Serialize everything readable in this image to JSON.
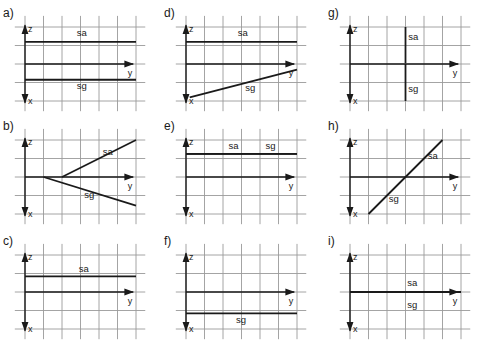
{
  "figure": {
    "colors": {
      "grid": "#9a9a9a",
      "lines": "#1a1a1a",
      "background": "#ffffff"
    },
    "axes": {
      "vertical_up": "z",
      "vertical_down": "x",
      "horizontal": "y"
    },
    "panels": [
      {
        "id": "a",
        "label": "a)",
        "col": 0,
        "row": 0,
        "traces": [
          {
            "name": "sa",
            "from": [
              0,
              -1.2
            ],
            "to": [
              6,
              -1.2
            ],
            "label_at": [
              2.8,
              -1.5
            ]
          },
          {
            "name": "sg",
            "from": [
              0,
              0.85
            ],
            "to": [
              6,
              0.85
            ],
            "label_at": [
              2.8,
              1.35
            ]
          }
        ]
      },
      {
        "id": "b",
        "label": "b)",
        "col": 0,
        "row": 1,
        "traces": [
          {
            "name": "sa",
            "from": [
              2,
              0
            ],
            "to": [
              6,
              -2
            ],
            "label_at": [
              4.2,
              -1.2
            ]
          },
          {
            "name": "sg",
            "from": [
              1,
              0
            ],
            "to": [
              6,
              1.55
            ],
            "label_at": [
              3.2,
              1.15
            ]
          }
        ]
      },
      {
        "id": "c",
        "label": "c)",
        "col": 0,
        "row": 2,
        "traces": [
          {
            "name": "sa",
            "from": [
              0,
              -0.85
            ],
            "to": [
              6,
              -0.85
            ],
            "label_at": [
              2.9,
              -1.1
            ]
          }
        ]
      },
      {
        "id": "d",
        "label": "d)",
        "col": 1,
        "row": 0,
        "traces": [
          {
            "name": "sa",
            "from": [
              0,
              -1.2
            ],
            "to": [
              6,
              -1.2
            ],
            "label_at": [
              2.8,
              -1.5
            ]
          },
          {
            "name": "sg",
            "from": [
              0.2,
              1.8
            ],
            "to": [
              6,
              0.3
            ],
            "label_at": [
              3.2,
              1.45
            ]
          }
        ]
      },
      {
        "id": "e",
        "label": "e)",
        "col": 1,
        "row": 1,
        "traces": [
          {
            "name": "sa",
            "from": [
              0,
              -1.25
            ],
            "to": [
              6,
              -1.25
            ],
            "label_at": [
              2.3,
              -1.5
            ]
          },
          {
            "name": "sg",
            "from": [
              0,
              -1.25
            ],
            "to": [
              6,
              -1.25
            ],
            "label_at": [
              4.3,
              -1.5
            ]
          }
        ]
      },
      {
        "id": "f",
        "label": "f)",
        "col": 1,
        "row": 2,
        "traces": [
          {
            "name": "sg",
            "from": [
              0,
              1.15
            ],
            "to": [
              6,
              1.15
            ],
            "label_at": [
              2.7,
              1.65
            ]
          }
        ]
      },
      {
        "id": "g",
        "label": "g)",
        "col": 2,
        "row": 0,
        "traces": [
          {
            "name": "sa",
            "from": [
              3,
              -2
            ],
            "to": [
              3,
              -0.05
            ],
            "label_at": [
              3.15,
              -1.3
            ]
          },
          {
            "name": "sg",
            "from": [
              3,
              0
            ],
            "to": [
              3,
              2
            ],
            "label_at": [
              3.15,
              1.5
            ]
          }
        ]
      },
      {
        "id": "h",
        "label": "h)",
        "col": 2,
        "row": 1,
        "traces": [
          {
            "name": "sa",
            "from": [
              3,
              0
            ],
            "to": [
              5,
              -2
            ],
            "label_at": [
              4.2,
              -0.95
            ]
          },
          {
            "name": "sg",
            "from": [
              1,
              2
            ],
            "to": [
              3,
              0
            ],
            "label_at": [
              2.1,
              1.35
            ]
          }
        ]
      },
      {
        "id": "i",
        "label": "i)",
        "col": 2,
        "row": 2,
        "traces": [
          {
            "name": "sa",
            "from": [
              0,
              0
            ],
            "to": [
              6,
              0
            ],
            "label_at": [
              3.1,
              -0.3
            ]
          },
          {
            "name": "sg",
            "from": [
              0,
              0
            ],
            "to": [
              6,
              0
            ],
            "label_at": [
              3.1,
              0.85
            ]
          }
        ]
      }
    ]
  }
}
